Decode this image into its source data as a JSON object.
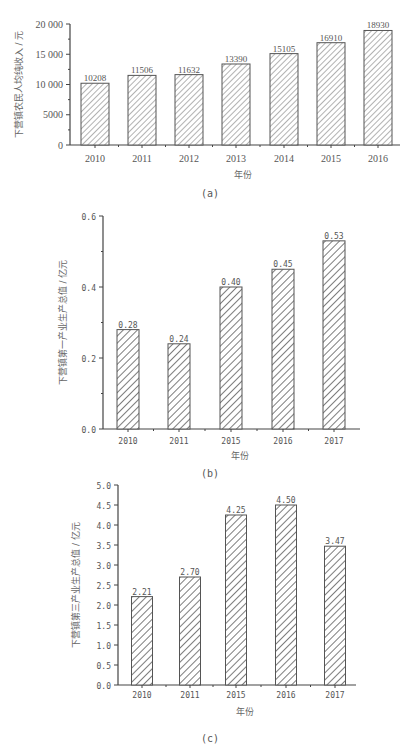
{
  "chart_data": [
    {
      "id": "a",
      "type": "bar",
      "caption": "(a)",
      "title": "",
      "xlabel": "年份",
      "ylabel": "下营镇农民人均纯收入 / 元",
      "categories": [
        "2010",
        "2011",
        "2012",
        "2013",
        "2014",
        "2015",
        "2016"
      ],
      "values": [
        10208,
        11506,
        11632,
        13390,
        15105,
        16910,
        18930
      ],
      "data_labels": [
        "10208",
        "11506",
        "11632",
        "13390",
        "15105",
        "16910",
        "18930"
      ],
      "yticks": [
        "0",
        "5000",
        "10 000",
        "15 000",
        "20 000"
      ],
      "ylim": [
        0,
        20000
      ],
      "grid": false,
      "legend": null,
      "bar_style": "diagonal hatch"
    },
    {
      "id": "b",
      "type": "bar",
      "caption": "(b)",
      "title": "",
      "xlabel": "年份",
      "ylabel": "下营镇第一产业生产总值 / 亿元",
      "categories": [
        "2010",
        "2011",
        "2015",
        "2016",
        "2017"
      ],
      "values": [
        0.28,
        0.24,
        0.4,
        0.45,
        0.53
      ],
      "data_labels": [
        "0.28",
        "0.24",
        "0.40",
        "0.45",
        "0.53"
      ],
      "yticks": [
        "0.0",
        "0.2",
        "0.4",
        "0.6"
      ],
      "ylim": [
        0,
        0.6
      ],
      "grid": false,
      "legend": null,
      "bar_style": "diagonal hatch"
    },
    {
      "id": "c",
      "type": "bar",
      "caption": "(c)",
      "title": "",
      "xlabel": "年份",
      "ylabel": "下营镇第三产业生产总值 / 亿元",
      "categories": [
        "2010",
        "2011",
        "2015",
        "2016",
        "2017"
      ],
      "values": [
        2.21,
        2.7,
        4.25,
        4.5,
        3.47
      ],
      "data_labels": [
        "2.21",
        "2.70",
        "4.25",
        "4.50",
        "3.47"
      ],
      "yticks": [
        "0.0",
        "0.5",
        "1.0",
        "1.5",
        "2.0",
        "2.5",
        "3.0",
        "3.5",
        "4.0",
        "4.5",
        "5.0"
      ],
      "ylim": [
        0,
        5.0
      ],
      "grid": false,
      "legend": null,
      "bar_style": "diagonal hatch"
    }
  ],
  "colors": {
    "axis": "#444444",
    "bar_outline": "#555555",
    "hatch": "#555555",
    "text": "#555555"
  }
}
